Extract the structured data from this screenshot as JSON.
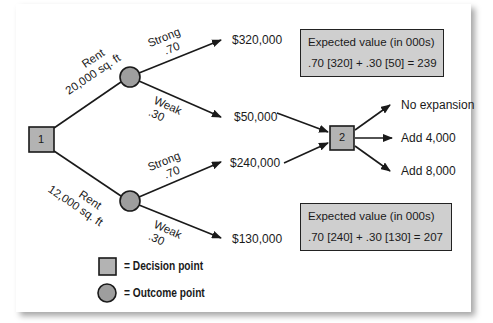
{
  "colors": {
    "node_fill": "#b3b3b3",
    "box_fill": "#cfcfcf",
    "line": "#1a1a1a"
  },
  "nodes": {
    "decision_1": {
      "label": "1"
    },
    "decision_2": {
      "label": "2"
    }
  },
  "branches": {
    "rent_20000": {
      "line1": "Rent",
      "line2": "20,000 sq. ft"
    },
    "rent_12000": {
      "line1": "Rent",
      "line2": "12,000 sq. ft"
    },
    "upper_strong": {
      "line1": "Strong",
      "line2": ".70"
    },
    "upper_weak": {
      "line1": "Weak",
      "line2": ".30"
    },
    "lower_strong": {
      "line1": "Strong",
      "line2": ".70"
    },
    "lower_weak": {
      "line1": "Weak",
      "line2": ".30"
    }
  },
  "payoffs": {
    "upper_strong": "$320,000",
    "upper_weak": "$50,000",
    "lower_strong": "$240,000",
    "lower_weak": "$130,000"
  },
  "expansion_options": [
    "No expansion",
    "Add 4,000",
    "Add 8,000"
  ],
  "expected_values": {
    "top": {
      "title": "Expected value (in 000s)",
      "formula": ".70 [320] + .30 [50] = 239"
    },
    "bottom": {
      "title": "Expected value (in 000s)",
      "formula": ".70 [240] + .30 [130] = 207"
    }
  },
  "legend": {
    "decision": "= Decision point",
    "outcome": "= Outcome point"
  }
}
